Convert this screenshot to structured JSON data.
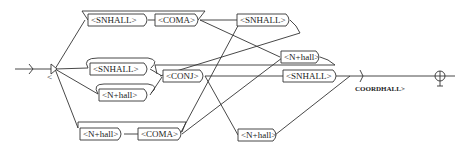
{
  "graph": {
    "name": "COORDHALL",
    "output_label": "COORDHALL>",
    "initial_state_label": "<",
    "nodes": {
      "n1": "<SNHALL>",
      "n2": "<COMA>",
      "n3": "<SNHALL>",
      "n4": "<SNHALL>",
      "n5": "<N+hall>",
      "n6": "<CONJ>",
      "n7": "<N+hall>",
      "n8": "<SNHALL>",
      "n9": "<N+hall>",
      "n10": "<COMA>",
      "n11": "<N+hall>"
    },
    "colors": {
      "line": "#333333",
      "background": "#ffffff"
    }
  }
}
